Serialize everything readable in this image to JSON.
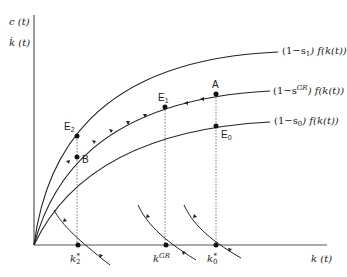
{
  "diagram": {
    "axes": {
      "y_label_top": "c (t)",
      "y_label_bottom": "k̇ (t)",
      "x_label": "k (t)"
    },
    "curves": [
      {
        "id": "s1",
        "label_prefix": "(1−s",
        "label_sub": "1",
        "label_suffix": ") f(k(t))"
      },
      {
        "id": "sGR",
        "label_prefix": "(1−s",
        "label_sup": "GR",
        "label_suffix": ") f(k(t))"
      },
      {
        "id": "s0",
        "label_prefix": "(1−s",
        "label_sub": "0",
        "label_suffix": ") f(k(t))"
      }
    ],
    "points": {
      "A": "A",
      "E0": {
        "base": "E",
        "sub": "0"
      },
      "E1": {
        "base": "E",
        "sub": "1"
      },
      "E2": {
        "base": "E",
        "sub": "2"
      },
      "B": "B"
    },
    "k_ticks": {
      "k2": {
        "base": "k",
        "sub": "2",
        "sup": "*"
      },
      "kGR": {
        "base": "k",
        "sup": "GR"
      },
      "k0": {
        "base": "k",
        "sub": "0",
        "sup": "*"
      }
    }
  }
}
